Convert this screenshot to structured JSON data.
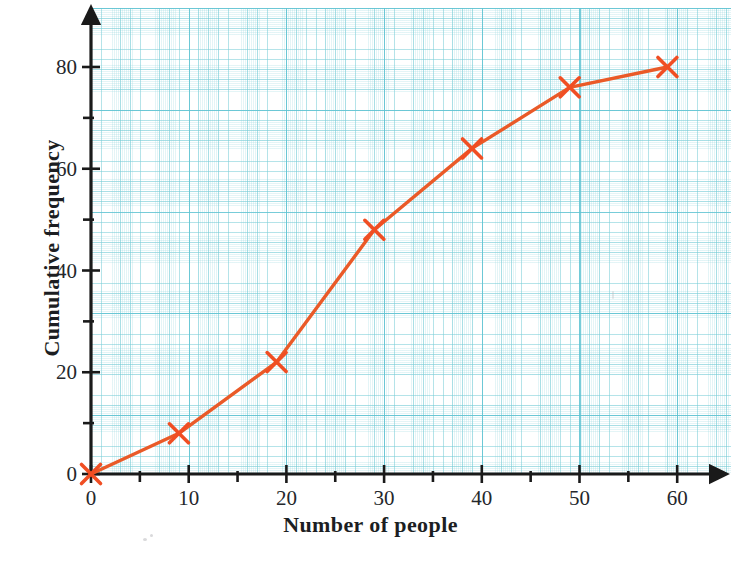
{
  "chart_data": {
    "type": "line",
    "title": "",
    "xlabel": "Number of people",
    "ylabel": "Cumulative frequency",
    "xlim": [
      0,
      65
    ],
    "ylim": [
      0,
      88
    ],
    "grid": true,
    "legend": "none",
    "marker": "x",
    "line_color": "#EA5A28",
    "marker_color": "#F04E23",
    "axis_color": "#1a1a1a",
    "grid_color": "#7FCBD7",
    "x": [
      0,
      9,
      19,
      29,
      39,
      49,
      59
    ],
    "y": [
      0,
      8,
      22,
      48,
      64,
      76,
      80
    ],
    "points": [
      {
        "x": 0,
        "y": 0
      },
      {
        "x": 9,
        "y": 8
      },
      {
        "x": 19,
        "y": 22
      },
      {
        "x": 29,
        "y": 48
      },
      {
        "x": 39,
        "y": 64
      },
      {
        "x": 49,
        "y": 76
      },
      {
        "x": 59,
        "y": 80
      }
    ],
    "x_ticks_major": [
      0,
      10,
      20,
      30,
      40,
      50,
      60
    ],
    "x_ticks_minor": [
      5,
      15,
      25,
      35,
      45,
      55
    ],
    "y_ticks_major": [
      0,
      20,
      40,
      60,
      80
    ],
    "y_ticks_minor": [
      10,
      30,
      50,
      70
    ],
    "x_tick_labels": [
      "0",
      "10",
      "20",
      "30",
      "40",
      "50",
      "60"
    ],
    "y_tick_labels": [
      "0",
      "20",
      "40",
      "60",
      "80"
    ]
  },
  "axes": {
    "x_title": "Number of people",
    "y_title": "Cumulative frequency"
  }
}
